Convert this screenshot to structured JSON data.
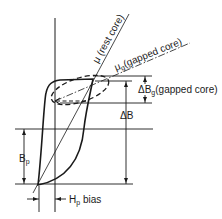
{
  "diagram": {
    "type": "B-H hysteresis loop with bias",
    "colors": {
      "ink": "#1a1a1a",
      "background": "#ffffff"
    },
    "labels": {
      "mu_rest": "μ (rest core)",
      "mu_gapped_sym": "μ",
      "mu_gapped_sub": "g",
      "mu_gapped_rest": "(gapped core)",
      "delta_bg_sym": "ΔB",
      "delta_bg_sub": "g",
      "delta_bg_rest": "(gapped core)",
      "delta_b": "ΔB",
      "bp_sym": "B",
      "bp_sub": "p",
      "hp_sym": "H",
      "hp_sub": "p",
      "hp_rest": " bias"
    }
  }
}
